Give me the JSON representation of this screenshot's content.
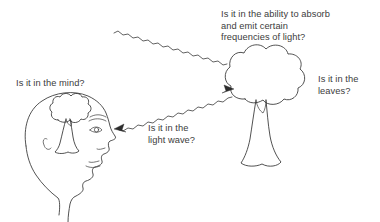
{
  "canvas": {
    "width": 380,
    "height": 222,
    "background_color": "#ffffff",
    "ink_color": "#333333",
    "text_color": "#3c3c3c"
  },
  "labels": {
    "mind": "Is it in the mind?",
    "absorb": "Is it in the ability to absorb\nand emit certain\nfrequencies of light?",
    "leaves": "Is it in the\nleaves?",
    "light_wave": "Is it in the\nlight wave?"
  },
  "figures": {
    "head": "human-head-profile-facing-right",
    "brain_tree": "tree-inside-head",
    "tree": "broadleaf-tree",
    "incoming_wave": "wavy-light-ray-into-tree",
    "outgoing_wave": "wavy-light-ray-into-eye"
  }
}
